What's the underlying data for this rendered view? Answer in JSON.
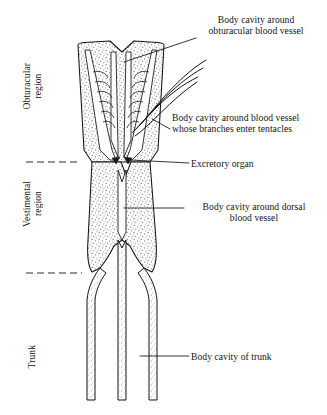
{
  "figure": {
    "background_color": "#ffffff",
    "ink_color": "#141414",
    "stipple_color": "#5a5a5a"
  },
  "region_labels": [
    {
      "id": "obturacular",
      "text": "Obturacular\nregion",
      "x": 22,
      "y": 63,
      "orientation": "vertical"
    },
    {
      "id": "vestimental",
      "text": "Vestimental\nregion",
      "x": 22,
      "y": 181,
      "orientation": "vertical"
    },
    {
      "id": "trunk",
      "text": "Trunk",
      "x": 27,
      "y": 345,
      "orientation": "vertical"
    }
  ],
  "callouts": [
    {
      "id": "obturacular-blood-vessel",
      "text": "Body cavity around\nobturacular blood vessel",
      "x": 187,
      "y": 14,
      "align": "center",
      "leader": "from label lower-left down to obturacular vessel lumen"
    },
    {
      "id": "tentacle-blood-vessel",
      "text": "Body cavity around blood vessel\nwhose branches enter tentacles",
      "x": 172,
      "y": 112,
      "align": "left",
      "leader": "short diagonal to right-hand vessel channel"
    },
    {
      "id": "excretory-organ",
      "text": "Excretory organ",
      "x": 191,
      "y": 158,
      "align": "left",
      "leader": "horizontal line to paired dark excretory organs"
    },
    {
      "id": "dorsal-blood-vessel",
      "text": "Body cavity around dorsal\nblood vessel",
      "x": 186,
      "y": 201,
      "align": "center",
      "leader": "horizontal line to central dorsal channel"
    },
    {
      "id": "trunk-body-cavity",
      "text": "Body cavity of trunk",
      "x": 191,
      "y": 351,
      "align": "left",
      "leader": "horizontal line to right trunk tube"
    }
  ],
  "dividers": [
    {
      "id": "obturacular-vestimental-divider",
      "y": 162,
      "x1": 26,
      "x2": 78,
      "style": "dashed"
    },
    {
      "id": "vestimental-trunk-divider",
      "y": 273,
      "x1": 26,
      "x2": 80,
      "style": "dashed"
    }
  ],
  "anatomy": {
    "parts": [
      "obturacular-region-body",
      "obturacular-vessel-channels",
      "tentacle-branch-ladders",
      "tentacle-filaments",
      "vestimental-region-body",
      "excretory-organs",
      "dorsal-vessel-channel",
      "trunk-tubes"
    ],
    "tentacle_filament_count": 3
  }
}
